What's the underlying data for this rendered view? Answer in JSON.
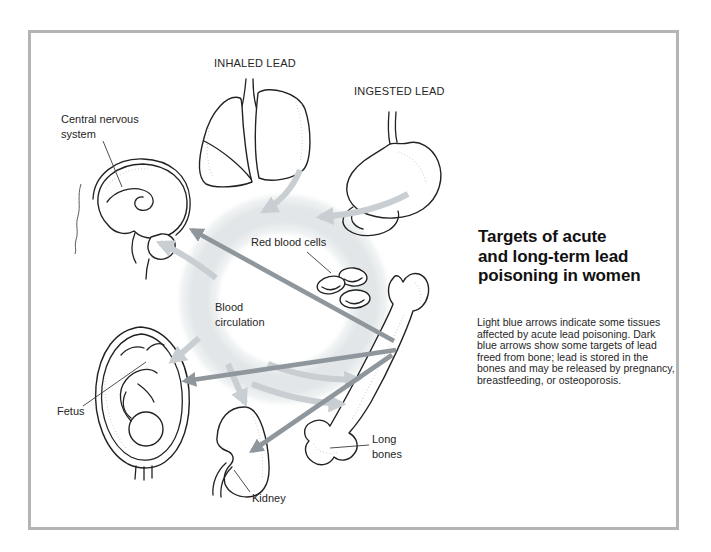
{
  "figure": {
    "title_lines": [
      "Targets of acute",
      "and long-term lead",
      "poisoning in women"
    ],
    "caption": "Light blue arrows indicate some tissues affected by acute lead poisoning. Dark blue arrows show some targets of lead freed from bone; lead is stored in the bones and may be released by pregnancy, breastfeeding, or osteoporosis."
  },
  "labels": {
    "inhaled_lead": "INHALED LEAD",
    "ingested_lead": "INGESTED LEAD",
    "central_nervous_system": "Central nervous system",
    "red_blood_cells": "Red blood cells",
    "blood_circulation": "Blood circulation",
    "fetus": "Fetus",
    "kidney": "Kidney",
    "long_bones": "Long bones"
  },
  "arrows": {
    "light_blue_acute": [
      {
        "from": "inhaled lead (lungs)",
        "to": "blood circulation"
      },
      {
        "from": "ingested lead (stomach)",
        "to": "blood circulation"
      },
      {
        "from": "blood circulation",
        "to": "central nervous system"
      },
      {
        "from": "blood circulation",
        "to": "fetus"
      },
      {
        "from": "blood circulation",
        "to": "kidney"
      },
      {
        "from": "blood circulation",
        "to": "long bones"
      },
      {
        "from": "blood circulation",
        "to": "long bones"
      }
    ],
    "dark_blue_bone_release": [
      {
        "from": "long bones",
        "to": "central nervous system"
      },
      {
        "from": "long bones",
        "to": "fetus"
      },
      {
        "from": "long bones",
        "to": "kidney"
      }
    ]
  },
  "colors": {
    "light_arrow": "#c8ced2",
    "dark_arrow": "#8f969c",
    "ring": "#e2e6e8",
    "ring_halo": "#edf0f1",
    "outline": "#222222",
    "frame_border": "#b3b5b4",
    "text": "#262626"
  }
}
